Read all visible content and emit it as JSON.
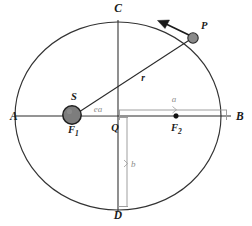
{
  "diagram": {
    "colors": {
      "stroke": "#2b2b2b",
      "orbit_stroke": "#333333",
      "dimension": "#9a9a9a",
      "sun_fill": "#7d7d7d",
      "planet_fill": "#8a8a8a",
      "focus_fill": "#111111",
      "background": "#ffffff",
      "label": "#1a1a1a",
      "dim_label": "#8d8d8d"
    },
    "vertices": [
      {
        "name": "vertex-a",
        "label": "A",
        "x": 10,
        "y": 120,
        "anchor": "start"
      },
      {
        "name": "vertex-b",
        "label": "B",
        "x": 236,
        "y": 120,
        "anchor": "start"
      },
      {
        "name": "vertex-c",
        "label": "C",
        "x": 118,
        "y": 12,
        "anchor": "middle"
      },
      {
        "name": "vertex-d",
        "label": "D",
        "x": 118,
        "y": 219,
        "anchor": "middle"
      }
    ],
    "points": [
      {
        "name": "sun",
        "label": "S",
        "label_x": 74,
        "label_y": 100,
        "cx": 72,
        "cy": 115,
        "r": 9.2
      },
      {
        "name": "focus-one",
        "label": "F",
        "subscript": "1",
        "label_x": 68,
        "label_y": 133
      },
      {
        "name": "planet",
        "label": "P",
        "label_x": 201,
        "label_y": 29,
        "cx": 193,
        "cy": 38,
        "r": 5.2
      },
      {
        "name": "focus-two",
        "label": "F",
        "subscript": "2",
        "label_x": 171,
        "label_y": 131,
        "cx": 176,
        "cy": 116,
        "r": 2.3
      },
      {
        "name": "center",
        "label": "Q",
        "label_x": 115,
        "label_y": 131
      }
    ],
    "dimensions": [
      {
        "name": "semi-major-axis",
        "label": "a",
        "label_x": 174,
        "label_y": 102
      },
      {
        "name": "semi-minor-axis",
        "label": "b",
        "label_x": 131,
        "label_y": 167
      },
      {
        "name": "focal-distance",
        "label": "ea",
        "label_x": 98,
        "label_y": 112
      },
      {
        "name": "radius-vector",
        "label": "r",
        "label_x": 143,
        "label_y": 81
      }
    ],
    "ellipse": {
      "cx": 118,
      "cy": 116,
      "rx": 103,
      "ry": 94
    },
    "velocity_arrow": {
      "from_x": 190,
      "from_y": 36,
      "to_x": 158,
      "to_y": 21
    }
  }
}
